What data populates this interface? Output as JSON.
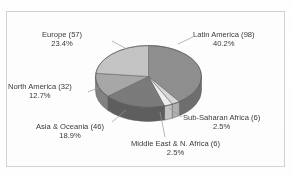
{
  "figure": {
    "title_remnant": "",
    "frame_color": "#d2d2d2",
    "background": "#ffffff"
  },
  "chart_data": {
    "type": "pie",
    "title": "",
    "subtitle": "",
    "xlabel": "",
    "ylabel": "",
    "legend_position": "none",
    "grid": false,
    "style": "3d-exploded-none",
    "total_count": 245,
    "categories": [
      "Latin America",
      "Sub-Saharan Africa",
      "Middle East & N. Africa",
      "Asia & Oceania",
      "North America",
      "Europe"
    ],
    "values": [
      98,
      6,
      6,
      46,
      32,
      57
    ],
    "percentages": [
      40.2,
      2.5,
      2.5,
      18.9,
      12.7,
      23.4
    ],
    "slice_colors": [
      "#8f8f8f",
      "#d8d8d8",
      "#efefef",
      "#7b7b7b",
      "#a8a8a8",
      "#c4c4c4"
    ],
    "slices": [
      {
        "name": "Latin America",
        "count": 98,
        "percent": 40.2,
        "label_name": "Latin America (98)",
        "label_pct": "40.2%",
        "color": "#8f8f8f",
        "side_color": "#6e6e6e"
      },
      {
        "name": "Sub-Saharan Africa",
        "count": 6,
        "percent": 2.5,
        "label_name": "Sub-Saharan Africa (6)",
        "label_pct": "2.5%",
        "color": "#d8d8d8",
        "side_color": "#b0b0b0"
      },
      {
        "name": "Middle East & N. Africa",
        "count": 6,
        "percent": 2.5,
        "label_name": "Middle East & N. Africa (6)",
        "label_pct": "2.5%",
        "color": "#efefef",
        "side_color": "#c6c6c6"
      },
      {
        "name": "Asia & Oceania",
        "count": 46,
        "percent": 18.9,
        "label_name": "Asia & Oceania (46)",
        "label_pct": "18.9%",
        "color": "#7b7b7b",
        "side_color": "#5e5e5e"
      },
      {
        "name": "North America",
        "count": 32,
        "percent": 12.7,
        "label_name": "North America (32)",
        "label_pct": "12.7%",
        "color": "#a8a8a8",
        "side_color": "#828282"
      },
      {
        "name": "Europe",
        "count": 57,
        "percent": 23.4,
        "label_name": "Europe (57)",
        "label_pct": "23.4%",
        "color": "#c4c4c4",
        "side_color": "#9a9a9a"
      }
    ]
  }
}
